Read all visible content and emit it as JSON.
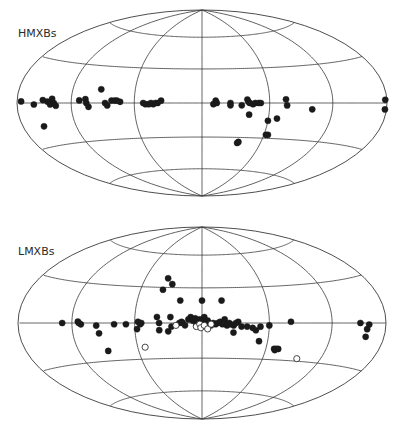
{
  "chart_data": [
    {
      "type": "scatter",
      "projection": "Hammer-Aitoff (galactic coordinates)",
      "title": "HMXBs",
      "graticule": {
        "meridians_deg": [
          -120,
          -60,
          0,
          60,
          120
        ],
        "parallels_deg": [
          -60,
          -30,
          0,
          30,
          60
        ]
      },
      "xlabel": "galactic longitude l (deg, 180 at left edge, -180 at right edge)",
      "ylabel": "galactic latitude b (deg)",
      "series": [
        {
          "name": "HMXB (filled)",
          "marker": "filled-circle",
          "points": [
            [
              175,
              1
            ],
            [
              160,
              -1
            ],
            [
              150,
              2
            ],
            [
              145,
              1
            ],
            [
              142,
              -1
            ],
            [
              140,
              3
            ],
            [
              138,
              0
            ],
            [
              136,
              -2
            ],
            [
              155,
              -16
            ],
            [
              112,
              2
            ],
            [
              106,
              3
            ],
            [
              105,
              0
            ],
            [
              103,
              -3
            ],
            [
              92,
              11
            ],
            [
              87,
              0
            ],
            [
              85,
              -2
            ],
            [
              81,
              2
            ],
            [
              78,
              2
            ],
            [
              76,
              2
            ],
            [
              73,
              1
            ],
            [
              52,
              0
            ],
            [
              50,
              -1
            ],
            [
              47,
              -1
            ],
            [
              45,
              0
            ],
            [
              43,
              -1
            ],
            [
              41,
              0
            ],
            [
              39,
              0
            ],
            [
              36,
              2
            ],
            [
              -10,
              -1
            ],
            [
              -12,
              2
            ],
            [
              -13,
              0
            ],
            [
              -25,
              0
            ],
            [
              -25,
              -2
            ],
            [
              -35,
              -2
            ],
            [
              -40,
              3
            ],
            [
              -41,
              1
            ],
            [
              -42,
              0
            ],
            [
              -45,
              -1
            ],
            [
              -47,
              0
            ],
            [
              -50,
              0
            ],
            [
              -52,
              0
            ],
            [
              -42,
              -10
            ],
            [
              -60,
              -15
            ],
            [
              -68,
              -13
            ],
            [
              -62,
              -27
            ],
            [
              -64,
              -27
            ],
            [
              -36,
              -35
            ],
            [
              -37,
              -34
            ],
            [
              -75,
              3
            ],
            [
              -76,
              -2
            ],
            [
              -100,
              -5
            ],
            [
              -178,
              2
            ],
            [
              -178,
              -4
            ]
          ]
        }
      ]
    },
    {
      "type": "scatter",
      "projection": "Hammer-Aitoff (galactic coordinates)",
      "title": "LMXBs",
      "graticule": {
        "meridians_deg": [
          -120,
          -60,
          0,
          60,
          120
        ],
        "parallels_deg": [
          -60,
          -30,
          0,
          30,
          60
        ]
      },
      "xlabel": "galactic longitude l (deg, 180 at left edge, -180 at right edge)",
      "ylabel": "galactic latitude b (deg)",
      "series": [
        {
          "name": "LMXB (filled)",
          "marker": "filled-circle",
          "points": [
            [
              130,
              0
            ],
            [
              114,
              1
            ],
            [
              113,
              0
            ],
            [
              111,
              -1
            ],
            [
              96,
              -2
            ],
            [
              94,
              -8
            ],
            [
              79,
              -1
            ],
            [
              68,
              -1
            ],
            [
              57,
              1
            ],
            [
              58,
              -5
            ],
            [
              55,
              -1
            ],
            [
              54,
              0
            ],
            [
              38,
              28
            ],
            [
              36,
              38
            ],
            [
              30,
              33
            ],
            [
              20,
              19
            ],
            [
              0,
              19
            ],
            [
              -18,
              19
            ],
            [
              40,
              5
            ],
            [
              38,
              0
            ],
            [
              38,
              -6
            ],
            [
              30,
              -7
            ],
            [
              28,
              5
            ],
            [
              27,
              -3
            ],
            [
              20,
              0
            ],
            [
              18,
              1
            ],
            [
              17,
              0
            ],
            [
              15,
              -2
            ],
            [
              12,
              3
            ],
            [
              10,
              5
            ],
            [
              8,
              2
            ],
            [
              6,
              4
            ],
            [
              5,
              -2
            ],
            [
              4,
              0
            ],
            [
              2,
              3
            ],
            [
              0,
              2
            ],
            [
              -2,
              5
            ],
            [
              -3,
              1
            ],
            [
              -4,
              -1
            ],
            [
              -5,
              2
            ],
            [
              -6,
              0
            ],
            [
              -8,
              -2
            ],
            [
              -10,
              0
            ],
            [
              -12,
              -1
            ],
            [
              -14,
              0
            ],
            [
              -16,
              1
            ],
            [
              -18,
              -1
            ],
            [
              -20,
              3
            ],
            [
              -20,
              0
            ],
            [
              -22,
              -2
            ],
            [
              -24,
              0
            ],
            [
              -25,
              -1
            ],
            [
              -28,
              -2
            ],
            [
              -28,
              -8
            ],
            [
              -30,
              0
            ],
            [
              -32,
              1
            ],
            [
              -35,
              -3
            ],
            [
              -40,
              -3
            ],
            [
              -45,
              -4
            ],
            [
              -48,
              -6
            ],
            [
              -52,
              -3
            ],
            [
              -52,
              -15
            ],
            [
              -60,
              -2
            ],
            [
              -80,
              1
            ],
            [
              -68,
              -21
            ],
            [
              -69,
              -22
            ],
            [
              -70,
              -21
            ],
            [
              -72,
              -21
            ],
            [
              -150,
              0
            ],
            [
              -158,
              -4
            ],
            [
              -160,
              -1
            ],
            [
              -158,
              -9
            ],
            [
              90,
              -22
            ]
          ]
        },
        {
          "name": "LMXB (open)",
          "marker": "open-circle",
          "points": [
            [
              23,
              -2
            ],
            [
              5,
              -3
            ],
            [
              2,
              -1
            ],
            [
              1,
              -4
            ],
            [
              -2,
              -2
            ],
            [
              -5,
              -5
            ],
            [
              -8,
              -1
            ],
            [
              53,
              -20
            ],
            [
              -95,
              -28
            ]
          ]
        }
      ]
    }
  ],
  "panels": {
    "top": {
      "label": "HMXBs"
    },
    "bottom": {
      "label": "LMXBs"
    }
  },
  "style": {
    "line_color": "#3a3a3a",
    "dot_color": "#1a1a1a",
    "background": "#ffffff"
  }
}
